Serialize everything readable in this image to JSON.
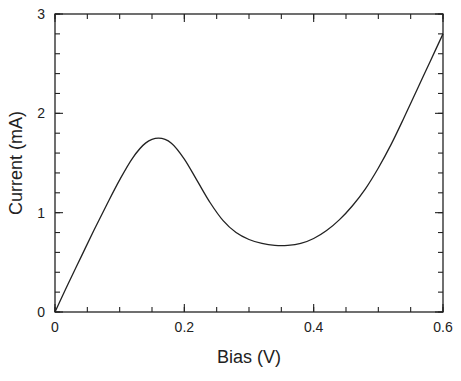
{
  "chart_data": {
    "type": "line",
    "title": "",
    "xlabel": "Bias (V)",
    "ylabel": "Current (mA)",
    "xlim": [
      0,
      0.6
    ],
    "ylim": [
      0,
      3
    ],
    "grid": false,
    "legend": null,
    "x_ticks": [
      0,
      0.2,
      0.4,
      0.6
    ],
    "x_tick_labels": [
      "0",
      "0.2",
      "0.4",
      "0.6"
    ],
    "x_minor_step": 0.05,
    "y_ticks": [
      0,
      1,
      2,
      3
    ],
    "y_tick_labels": [
      "0",
      "1",
      "2",
      "3"
    ],
    "y_minor_step": 0.2,
    "series": [
      {
        "name": "I-V curve",
        "color": "#222222",
        "x": [
          0,
          0.02,
          0.04,
          0.06,
          0.08,
          0.1,
          0.12,
          0.14,
          0.16,
          0.18,
          0.2,
          0.22,
          0.24,
          0.26,
          0.28,
          0.3,
          0.32,
          0.34,
          0.36,
          0.38,
          0.4,
          0.42,
          0.44,
          0.46,
          0.48,
          0.5,
          0.52,
          0.54,
          0.56,
          0.58,
          0.6
        ],
        "y": [
          0,
          0.28,
          0.55,
          0.82,
          1.08,
          1.33,
          1.55,
          1.7,
          1.75,
          1.7,
          1.54,
          1.32,
          1.1,
          0.92,
          0.8,
          0.73,
          0.69,
          0.67,
          0.67,
          0.69,
          0.74,
          0.82,
          0.93,
          1.07,
          1.24,
          1.45,
          1.69,
          1.96,
          2.24,
          2.52,
          2.8
        ]
      }
    ]
  }
}
